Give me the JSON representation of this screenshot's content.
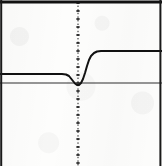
{
  "figure": {
    "width": 162,
    "height": 166,
    "background_color": "#fdfdfc",
    "ink_color": "#111111",
    "appearance": "scanned photocopy, no labels or text"
  },
  "frame": {
    "top_border": true,
    "left_border": true,
    "right_border": true,
    "bottom_border": false,
    "top_border_thickness": 3,
    "side_border_thickness": 2,
    "color": "#111111"
  },
  "axes": {
    "y_axis": {
      "x_pixel": 78,
      "style": "dotted-with-tick-dashes",
      "tick_count": 20,
      "tick_spacing_px": 8,
      "color": "#1a1a1a",
      "spans_full_height": true
    },
    "x_axis": {
      "y_pixel": 83,
      "style": "solid-thin",
      "color": "#2a2a2a",
      "spans_full_width": true
    }
  },
  "chart_data": {
    "type": "line",
    "title": "",
    "subtitle": "",
    "xlabel": "",
    "ylabel": "",
    "grid": false,
    "legend": null,
    "annotations": [],
    "xlim": [
      -78,
      84
    ],
    "ylim": [
      -83,
      83
    ],
    "xticks": [],
    "yticks": [],
    "series": [
      {
        "name": "response",
        "line_width_px": 2,
        "color": "#111111",
        "points_px": [
          [
            0,
            74
          ],
          [
            12,
            74
          ],
          [
            24,
            74
          ],
          [
            36,
            74
          ],
          [
            46,
            74
          ],
          [
            55,
            74
          ],
          [
            62,
            74
          ],
          [
            66,
            74.5
          ],
          [
            69,
            76
          ],
          [
            71,
            78.5
          ],
          [
            73,
            81
          ],
          [
            75,
            83.5
          ],
          [
            77,
            85
          ],
          [
            79,
            85
          ],
          [
            81,
            83
          ],
          [
            83,
            79
          ],
          [
            85,
            73
          ],
          [
            87,
            66
          ],
          [
            89,
            60
          ],
          [
            91,
            56
          ],
          [
            94,
            53
          ],
          [
            97,
            51.5
          ],
          [
            101,
            51
          ],
          [
            110,
            51
          ],
          [
            124,
            51
          ],
          [
            140,
            51
          ],
          [
            155,
            51
          ],
          [
            162,
            51
          ]
        ]
      }
    ]
  }
}
